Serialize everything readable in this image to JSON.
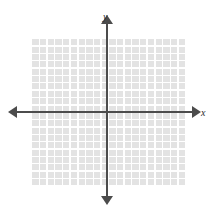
{
  "figure": {
    "kind": "cartesian-coordinate-plane",
    "title": "",
    "background_color": "#ffffff"
  },
  "grid": {
    "fill_color": "#e3e3e3",
    "line_color": "#ffffff",
    "columns": 20,
    "rows": 20,
    "cell_width_px": 7.7,
    "cell_height_px": 7.35,
    "left_px": 31,
    "top_px": 38,
    "width_px": 154,
    "height_px": 147
  },
  "axes": {
    "color": "#4c4c4c",
    "thickness_px": 2,
    "origin": {
      "x_px": 107,
      "y_px": 112
    },
    "x_axis": {
      "label": "x",
      "label_style": "italic-serif",
      "arrow_left": true,
      "arrow_right": true,
      "tick_labels": [],
      "numbers_shown": false
    },
    "y_axis": {
      "label": "y",
      "label_style": "italic-serif",
      "arrow_up": true,
      "arrow_down": true,
      "tick_labels": [],
      "numbers_shown": false
    }
  },
  "plotted_elements": {
    "points": [],
    "lines": [],
    "curves": [],
    "annotations": []
  }
}
